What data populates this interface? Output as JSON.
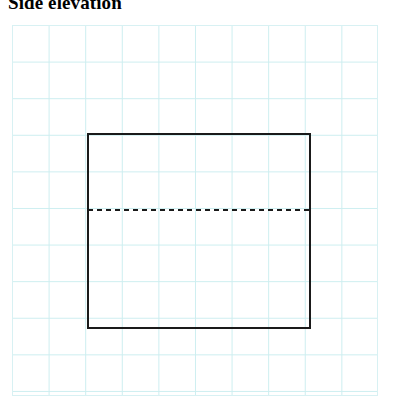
{
  "page": {
    "width": 398,
    "height": 401,
    "background_color": "#ffffff"
  },
  "title": {
    "text": "Side elevation",
    "color": "#000000",
    "clipped_at_top": true
  },
  "grid": {
    "name": "graph-paper-grid",
    "line_color": "#cdeef0",
    "background_color": "#ffffff",
    "cell_size_px": 36.6,
    "columns": 10,
    "rows": 10,
    "left": 12,
    "top": 25,
    "width": 366,
    "height": 371
  },
  "drawing": {
    "stroke_color": "#1a1a1a",
    "stroke_width": 2,
    "rectangle": {
      "name": "elevation-outline-rectangle",
      "x": 88,
      "y": 134,
      "width": 222,
      "height": 194,
      "style": "solid"
    },
    "dashed_line": {
      "name": "hidden-detail-dashed-line",
      "x1": 88,
      "y1": 210,
      "x2": 310,
      "y2": 210,
      "style": "dashed",
      "dash_length": 5,
      "gap_length": 4,
      "stroke_width": 2
    }
  }
}
